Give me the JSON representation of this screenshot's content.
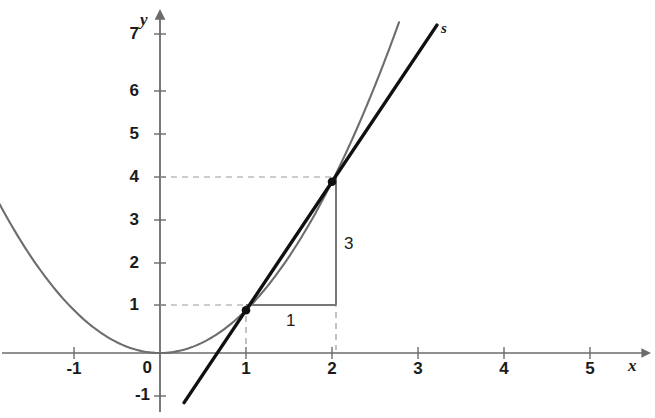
{
  "chart_data": {
    "type": "line",
    "title": "",
    "subtitle": "",
    "xlabel": "x",
    "ylabel": "y",
    "xlim": [
      -1.85,
      5.7
    ],
    "ylim": [
      -1.55,
      7.6
    ],
    "grid": false,
    "legend_position": "none",
    "x_ticks": [
      "-1",
      "0",
      "1",
      "2",
      "3",
      "4",
      "5"
    ],
    "x_tick_values": [
      -1,
      0,
      1,
      2,
      3,
      4,
      5
    ],
    "y_ticks": [
      "-1",
      "0",
      "1",
      "2",
      "3",
      "4",
      "5",
      "6",
      "7"
    ],
    "y_tick_values": [
      -1,
      0,
      1,
      2,
      3,
      4,
      5,
      6,
      7
    ],
    "series": [
      {
        "name": "parabola",
        "label": "",
        "type": "curve",
        "equation": "y = x^2",
        "color": "#6d6d6d",
        "x_range": [
          -1.95,
          2.78
        ],
        "points": [
          {
            "x": -1.95,
            "y": 3.8
          },
          {
            "x": -1.5,
            "y": 2.25
          },
          {
            "x": -1.0,
            "y": 1.0
          },
          {
            "x": -0.5,
            "y": 0.25
          },
          {
            "x": 0.0,
            "y": 0.0
          },
          {
            "x": 0.5,
            "y": 0.25
          },
          {
            "x": 1.0,
            "y": 1.0
          },
          {
            "x": 1.5,
            "y": 2.25
          },
          {
            "x": 2.0,
            "y": 4.0
          },
          {
            "x": 2.5,
            "y": 6.25
          },
          {
            "x": 2.78,
            "y": 7.73
          }
        ]
      },
      {
        "name": "secant",
        "label": "s",
        "type": "line",
        "equation": "y = 3x - 2",
        "color": "#101010",
        "x_range": [
          0.28,
          3.22
        ],
        "endpoints": [
          {
            "x": 0.28,
            "y": -1.16
          },
          {
            "x": 3.22,
            "y": 7.66
          }
        ]
      }
    ],
    "markers": [
      {
        "name": "point-P",
        "x": 1,
        "y": 1,
        "color": "#101010"
      },
      {
        "name": "point-Q",
        "x": 2,
        "y": 4,
        "color": "#101010"
      }
    ],
    "slope_triangle": {
      "name": "slope-triangle",
      "from": {
        "x": 1,
        "y": 1
      },
      "to": {
        "x": 2,
        "y": 4
      },
      "horizontal_label": "1",
      "vertical_label": "3",
      "slope": 3,
      "color": "#777777"
    },
    "guide_lines": [
      {
        "name": "guide-y-4",
        "orientation": "horizontal",
        "value": 4,
        "from": 0,
        "to": 2
      },
      {
        "name": "guide-y-1",
        "orientation": "horizontal",
        "value": 1,
        "from": 0,
        "to": 1
      },
      {
        "name": "guide-x-1",
        "orientation": "vertical",
        "value": 1,
        "from": 0,
        "to": 1
      },
      {
        "name": "guide-x-2",
        "orientation": "vertical",
        "value": 2,
        "from": 0,
        "to": 1
      }
    ],
    "annotations": [
      {
        "name": "secant-label",
        "text": "s",
        "x": 3.32,
        "y": 7.65
      },
      {
        "name": "leg-label-horizontal",
        "text": "1",
        "x": 1.48,
        "y": 0.62
      },
      {
        "name": "leg-label-vertical",
        "text": "3",
        "x": 2.13,
        "y": 2.55
      },
      {
        "name": "x-axis-name",
        "text": "x",
        "x": 5.5,
        "y": -0.33
      },
      {
        "name": "y-axis-name",
        "text": "y",
        "x": -0.2,
        "y": 7.52
      }
    ],
    "colors": {
      "axis": "#6b6b6b",
      "parabola": "#6d6d6d",
      "secant": "#101010",
      "guide": "#9a9a9a",
      "triangle": "#777777",
      "text": "#1b1b1b",
      "background": "#ffffff"
    }
  }
}
